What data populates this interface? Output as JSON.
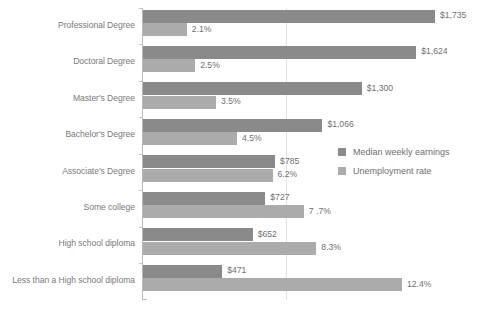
{
  "chart_data": {
    "type": "bar",
    "orientation": "horizontal",
    "title": "",
    "subtitle": "",
    "xlabel": "",
    "ylabel": "",
    "grid": true,
    "legend_position": "middle-right",
    "categories": [
      "Professional Degree",
      "Doctoral Degree",
      "Master's Degree",
      "Bachelor's Degree",
      "Associate's Degree",
      "Some college",
      "High school diploma",
      "Less than a High school diploma"
    ],
    "series": [
      {
        "name": "Median weekly earnings",
        "color": "#8a8a8a",
        "values": [
          1735,
          1624,
          1300,
          1066,
          785,
          727,
          652,
          471
        ],
        "labels": [
          "$1,735",
          "$1,624",
          "$1,300",
          "$1,066",
          "$785",
          "$727",
          "$652",
          "$471"
        ],
        "axis_max": 1735
      },
      {
        "name": "Unemployment rate",
        "color": "#ababab",
        "values": [
          2.1,
          2.5,
          3.5,
          4.5,
          6.2,
          7.7,
          8.3,
          12.4
        ],
        "labels": [
          "2.1%",
          "2.5%",
          "3.5%",
          "4.5%",
          "6.2%",
          "7 .7%",
          "8.3%",
          "12.4%"
        ],
        "axis_max": 12.4
      }
    ]
  },
  "legend": {
    "items": [
      {
        "label": "Median weekly earnings",
        "swatch": "earn"
      },
      {
        "label": "Unemployment rate",
        "swatch": "unemp"
      }
    ]
  },
  "colors": {
    "earnings_bar": "#8a8a8a",
    "unemployment_bar": "#ababab",
    "axis": "#b9b9b9",
    "gridline": "#e2e2e2",
    "text": "#7a7a7a",
    "background": "#ffffff"
  }
}
